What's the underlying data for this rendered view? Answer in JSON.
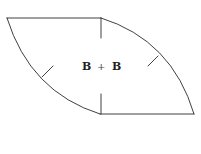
{
  "diagram": {
    "type": "curved-quadrilateral",
    "label": {
      "left": "B",
      "operator": "+",
      "right": "B"
    },
    "edges": [
      {
        "name": "top-edge",
        "kind": "straight"
      },
      {
        "name": "bottom-edge",
        "kind": "straight"
      },
      {
        "name": "left-arc",
        "kind": "arc"
      },
      {
        "name": "right-arc",
        "kind": "arc"
      }
    ],
    "tick_marks": [
      "top-vertical",
      "bottom-vertical",
      "left-arc-tick",
      "right-arc-tick"
    ],
    "stroke_color": "#2a2a2a",
    "background": "#ffffff"
  }
}
